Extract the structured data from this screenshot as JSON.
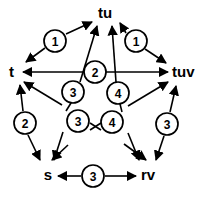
{
  "diagram": {
    "type": "directed-graph-pentagram",
    "title": "",
    "nodes": [
      {
        "id": "tu",
        "label": "tu",
        "x": 105,
        "y": 14,
        "anchor": "middle"
      },
      {
        "id": "t",
        "label": "t",
        "x": 9,
        "y": 73,
        "anchor": "start"
      },
      {
        "id": "tuv",
        "label": "tuv",
        "x": 172,
        "y": 73,
        "anchor": "start"
      },
      {
        "id": "s",
        "label": "s",
        "x": 48,
        "y": 176,
        "anchor": "middle"
      },
      {
        "id": "rv",
        "label": "rv",
        "x": 148,
        "y": 176,
        "anchor": "middle"
      }
    ],
    "edges": [
      {
        "id": "e1",
        "from": "tu",
        "to": "t",
        "badge": "1",
        "badge_x": 55,
        "badge_y": 41
      },
      {
        "id": "e2",
        "from": "tu",
        "to": "tuv",
        "badge": "1",
        "badge_x": 136,
        "badge_y": 41
      },
      {
        "id": "e3",
        "from": "t",
        "to": "tuv",
        "badge": "2",
        "badge_x": 95,
        "badge_y": 72
      },
      {
        "id": "e4",
        "from": "t",
        "to": "s",
        "badge": "2",
        "badge_x": 25,
        "badge_y": 123
      },
      {
        "id": "e5",
        "from": "tuv",
        "to": "rv",
        "badge": "3",
        "badge_x": 167,
        "badge_y": 124
      },
      {
        "id": "e6",
        "from": "s",
        "to": "rv",
        "badge": "3",
        "badge_x": 93,
        "badge_y": 176
      },
      {
        "id": "e7",
        "from": "s",
        "to": "tu",
        "badge": "3",
        "badge_x": 73,
        "badge_y": 92
      },
      {
        "id": "e8",
        "from": "s",
        "to": "tu",
        "badge": "3",
        "badge_x": 78,
        "badge_y": 121
      },
      {
        "id": "e9",
        "from": "rv",
        "to": "tu",
        "badge": "4",
        "badge_x": 118,
        "badge_y": 93
      },
      {
        "id": "e10",
        "from": "rv",
        "to": "tu",
        "badge": "4",
        "badge_x": 112,
        "badge_y": 122
      }
    ],
    "badges": [
      {
        "id": "badge-1-left",
        "value": "1",
        "cx": 55,
        "cy": 41,
        "r": 11
      },
      {
        "id": "badge-1-right",
        "value": "1",
        "cx": 136,
        "cy": 41,
        "r": 11
      },
      {
        "id": "badge-2-center",
        "value": "2",
        "cx": 95,
        "cy": 72,
        "r": 11
      },
      {
        "id": "badge-3-upper",
        "value": "3",
        "cx": 73,
        "cy": 92,
        "r": 11
      },
      {
        "id": "badge-4-upper",
        "value": "4",
        "cx": 118,
        "cy": 93,
        "r": 11
      },
      {
        "id": "badge-2-left",
        "value": "2",
        "cx": 25,
        "cy": 123,
        "r": 11
      },
      {
        "id": "badge-3-lower",
        "value": "3",
        "cx": 78,
        "cy": 121,
        "r": 11
      },
      {
        "id": "badge-4-lower",
        "value": "4",
        "cx": 112,
        "cy": 122,
        "r": 11
      },
      {
        "id": "badge-3-right",
        "value": "3",
        "cx": 167,
        "cy": 124,
        "r": 11
      },
      {
        "id": "badge-3-bottom",
        "value": "3",
        "cx": 93,
        "cy": 176,
        "r": 11
      }
    ],
    "colors": {
      "stroke": "#000000",
      "fill": "#ffffff",
      "text": "#000000"
    }
  }
}
